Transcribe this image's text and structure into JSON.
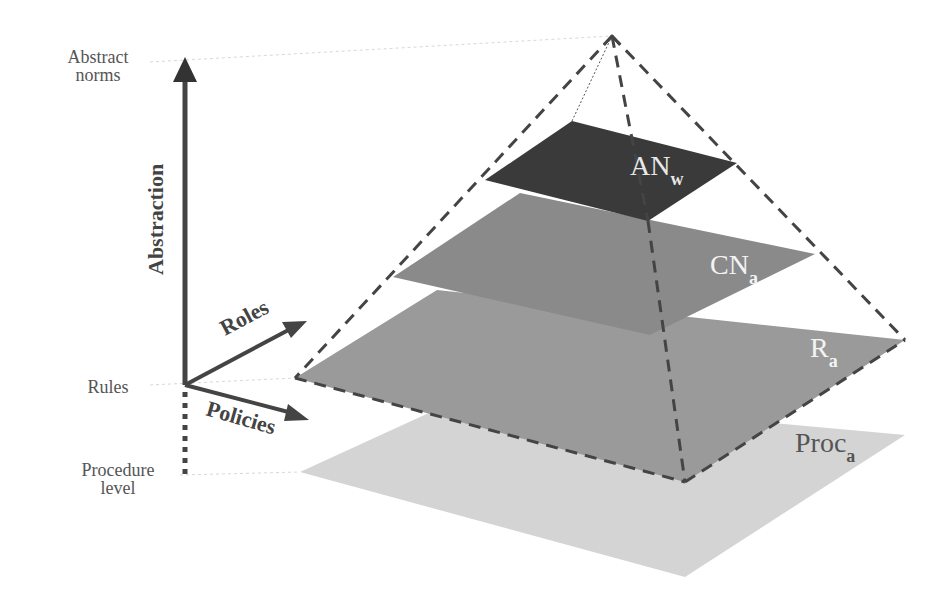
{
  "diagram": {
    "type": "layered-pyramid",
    "axis": {
      "vertical_label": "Abstraction",
      "roles_label": "Roles",
      "policies_label": "Policies"
    },
    "level_labels": {
      "top_line1": "Abstract",
      "top_line2": "norms",
      "middle": "Rules",
      "bottom_line1": "Procedure",
      "bottom_line2": "level"
    },
    "layers": [
      {
        "id": "AN",
        "label": "AN",
        "subscript": "w",
        "color": "#3a3a3a",
        "text_color": "#e8e8e8"
      },
      {
        "id": "CN",
        "label": "CN",
        "subscript": "a",
        "color": "#8a8a8a",
        "text_color": "#f4f4f4"
      },
      {
        "id": "R",
        "label": "R",
        "subscript": "a",
        "color": "#9a9a9a",
        "text_color": "#f4f4f4"
      },
      {
        "id": "Proc",
        "label": "Proc",
        "subscript": "a",
        "color": "#d4d4d4",
        "text_color": "#555555"
      }
    ],
    "colors": {
      "axis": "#444444",
      "dashed_outline": "#444444",
      "guide_lines": "#d8d8d8"
    }
  }
}
